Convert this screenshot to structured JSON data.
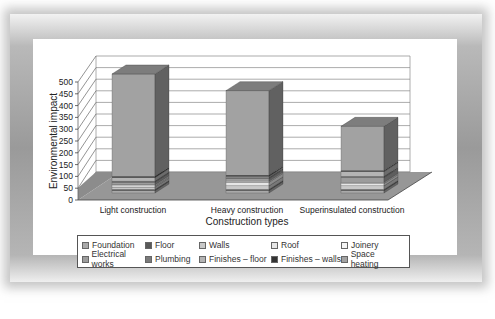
{
  "chart_data": {
    "type": "bar",
    "subtype": "stacked-3d-column",
    "title": "",
    "xlabel": "Construction types",
    "ylabel": "Environmental impact",
    "ylim": [
      0,
      500
    ],
    "yticks": [
      0,
      50,
      100,
      150,
      200,
      250,
      300,
      350,
      400,
      450,
      500
    ],
    "grid": true,
    "legend_position": "bottom",
    "categories": [
      "Light construction",
      "Heavy construction",
      "Superinsulated construction"
    ],
    "series": [
      {
        "name": "Foundation",
        "color": "#a9a9a9",
        "values": [
          10,
          10,
          10
        ]
      },
      {
        "name": "Floor",
        "color": "#595959",
        "values": [
          5,
          5,
          5
        ]
      },
      {
        "name": "Walls",
        "color": "#c8c8c8",
        "values": [
          10,
          15,
          15
        ]
      },
      {
        "name": "Roof",
        "color": "#e6e6e6",
        "values": [
          5,
          15,
          10
        ]
      },
      {
        "name": "Joinery",
        "color": "#f4f4f4",
        "values": [
          5,
          5,
          5
        ]
      },
      {
        "name": "Electrical works",
        "color": "#9c9c9c",
        "values": [
          10,
          10,
          20
        ]
      },
      {
        "name": "Plumbing",
        "color": "#7a7a7a",
        "values": [
          5,
          5,
          5
        ]
      },
      {
        "name": "Finishes – floor",
        "color": "#b4b4b4",
        "values": [
          15,
          5,
          20
        ]
      },
      {
        "name": "Finishes – walls",
        "color": "#333333",
        "values": [
          5,
          5,
          5
        ]
      },
      {
        "name": "Space heating",
        "color": "#a2a2a2",
        "values": [
          430,
          355,
          185
        ]
      }
    ],
    "totals": [
      500,
      430,
      280
    ]
  },
  "axis": {
    "y_ticks": [
      "500",
      "450",
      "400",
      "350",
      "300",
      "250",
      "200",
      "150",
      "100",
      "50",
      "0"
    ]
  },
  "legend": {
    "row1": [
      "Foundation",
      "Floor",
      "Walls",
      "Roof",
      "Joinery"
    ],
    "row2": [
      "Electrical works",
      "Plumbing",
      "Finishes – floor",
      "Finishes – walls",
      "Space heating"
    ]
  }
}
